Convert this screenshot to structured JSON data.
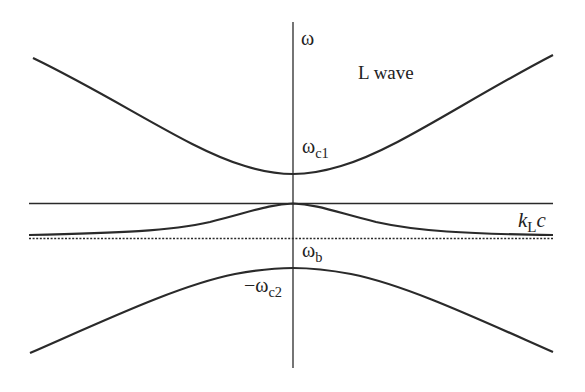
{
  "diagram": {
    "axis_label": "ω",
    "wave_label": "L wave",
    "labels": {
      "omega_c1": {
        "base": "ω",
        "sub": "c1"
      },
      "omega_b": {
        "base": "ω",
        "sub": "b"
      },
      "minus_omega_c2": {
        "base": "−ω",
        "sub": "c2"
      },
      "kLc": {
        "base": "k",
        "sub": "L",
        "tail": "c"
      }
    },
    "colors": {
      "line": "#2a2a2a",
      "background": "#ffffff"
    },
    "curves": [
      {
        "name": "upper-branch",
        "description": "hyperbolic branch above ωc1, minimum at ωc1 on axis"
      },
      {
        "name": "middle-branch",
        "description": "peaks at horizontal line on axis, asymptotes to kLc level"
      },
      {
        "name": "lower-branch",
        "description": "inverted hyperbolic branch below ωb, maximum near −ωc2"
      },
      {
        "name": "horizontal-line",
        "description": "solid horizontal reference line"
      },
      {
        "name": "dotted-line",
        "description": "dotted horizontal reference line at kLc"
      }
    ]
  }
}
